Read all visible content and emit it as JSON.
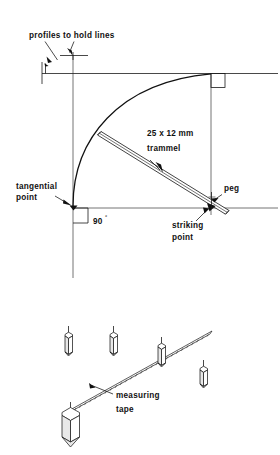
{
  "figure": {
    "upper_diagram": {
      "labels": {
        "profiles": "profiles to hold lines",
        "trammel_size": "25 x 12 mm",
        "trammel_name": "trammel",
        "tangential": "tangential",
        "point": "point",
        "angle_value": "90",
        "angle_unit": "°",
        "peg": "peg",
        "striking": "striking",
        "striking_point": "point"
      }
    },
    "lower_diagram": {
      "labels": {
        "measuring": "measuring",
        "tape": "tape"
      },
      "peg_count": 5
    },
    "colors": {
      "ink": "#111111",
      "line": "#1a1a1a",
      "paper": "#ffffff",
      "shade": "#e8e8e8"
    }
  }
}
